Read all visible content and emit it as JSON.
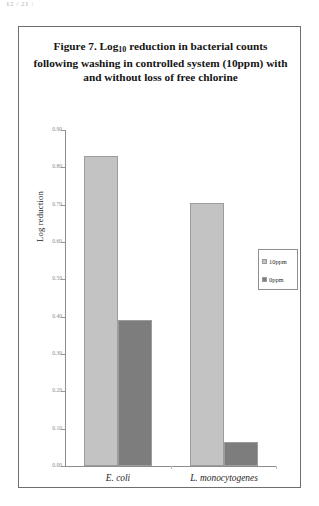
{
  "top_fragment": "12 / 21 :",
  "figure": {
    "title_line1_pre": "Figure 7. Log",
    "title_line1_sub": "10",
    "title_line1_post": " reduction in bacterial counts",
    "title_line2": "following washing in controlled system (10ppm) with",
    "title_line3": "and without loss of free chlorine"
  },
  "chart_data": {
    "type": "bar",
    "title": "Figure 7. Log10 reduction in bacterial counts following washing in controlled system (10ppm) with and without loss of free chlorine",
    "xlabel": "",
    "ylabel": "Log reduction",
    "categories": [
      "E. coli",
      "L. monocytogenes"
    ],
    "series": [
      {
        "name": "10ppm",
        "color": "#c3c3c3",
        "values": [
          0.83,
          0.705
        ]
      },
      {
        "name": "0ppm",
        "color": "#7d7d7d",
        "values": [
          0.39,
          0.065
        ]
      }
    ],
    "ylim": [
      0.0,
      0.9
    ],
    "ytick_step": 0.1,
    "yticks": [
      "0.90",
      "0.80",
      "0.70",
      "0.60",
      "0.50",
      "0.40",
      "0.30",
      "0.20",
      "0.10",
      "0.00"
    ],
    "grid": false,
    "legend_position": "right-middle"
  },
  "legend": {
    "items": [
      {
        "label": "10ppm",
        "color": "#c3c3c3"
      },
      {
        "label": "0ppm",
        "color": "#7d7d7d"
      }
    ]
  },
  "colors": {
    "series_10ppm": "#c3c3c3",
    "series_0ppm": "#7d7d7d",
    "axis": "#8d8d8d",
    "tick_label": "#8a8a8a",
    "border": "#6e6e6e"
  }
}
